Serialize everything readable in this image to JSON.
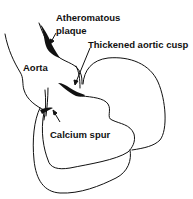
{
  "diagram": {
    "type": "anatomical line drawing",
    "labels": {
      "plaque_line1": "Atheromatous",
      "plaque_line2": "plaque",
      "cusp": "Thickened aortic cusp",
      "aorta": "Aorta",
      "spur": "Calcium spur"
    },
    "colors": {
      "line": "#111111",
      "fill": "#111111",
      "background": "#ffffff"
    }
  }
}
